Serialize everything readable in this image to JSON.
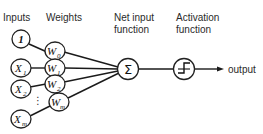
{
  "headers": {
    "inputs": "Inputs",
    "weights": "Weights",
    "net_input_line1": "Net input",
    "net_input_line2": "function",
    "activation_line1": "Activation",
    "activation_line2": "function"
  },
  "inputs": [
    {
      "label": "1",
      "sub": ""
    },
    {
      "label": "X",
      "sub": "1"
    },
    {
      "label": "X",
      "sub": "2"
    },
    {
      "label": "X",
      "sub": "m"
    }
  ],
  "weights": [
    {
      "label": "W",
      "sub": "0"
    },
    {
      "label": "W",
      "sub": "1"
    },
    {
      "label": "W",
      "sub": "2"
    },
    {
      "label": "W",
      "sub": "m"
    }
  ],
  "ellipsis": "⋮",
  "net_input_symbol": "Σ",
  "output_label": "output"
}
